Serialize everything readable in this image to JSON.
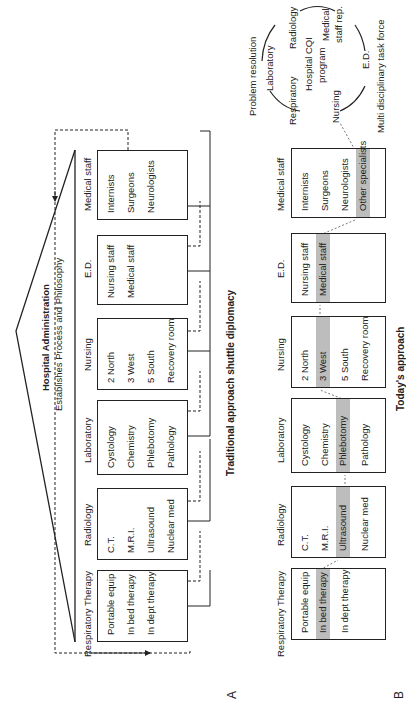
{
  "panel_a": {
    "label": "A",
    "title": "Hospital Administration",
    "subtitle": "Establishes Process and Philosophy",
    "caption": "Traditional approach shuttle diplomacy",
    "departments": [
      {
        "name": "Respiratory Therapy",
        "items": [
          "Portable equip",
          "In bed therapy",
          "In dept therapy"
        ]
      },
      {
        "name": "Radiology",
        "items": [
          "C.T.",
          "M.R.I.",
          "Ultrasound",
          "Nuclear med"
        ]
      },
      {
        "name": "Laboratory",
        "items": [
          "Cystology",
          "Chemistry",
          "Phlebotomy",
          "Pathology"
        ]
      },
      {
        "name": "Nursing",
        "items": [
          "2 North",
          "3 West",
          "5 South",
          "Recovery room"
        ]
      },
      {
        "name": "E.D.",
        "items": [
          "Nursing staff",
          "Medical staff"
        ]
      },
      {
        "name": "Medical staff",
        "items": [
          "Internists",
          "Surgeons",
          "Neurologists"
        ]
      }
    ]
  },
  "panel_b": {
    "label": "B",
    "caption": "Today's approach",
    "departments": [
      {
        "name": "Respiratory Therapy",
        "items": [
          "Portable equip",
          "In bed therapy",
          "In dept therapy"
        ],
        "highlight": 1
      },
      {
        "name": "Radiology",
        "items": [
          "C.T.",
          "M.R.I.",
          "Ultrasound",
          "Nuclear med"
        ],
        "highlight": 2
      },
      {
        "name": "Laboratory",
        "items": [
          "Cystology",
          "Chemistry",
          "Phlebotomy",
          "Pathology"
        ],
        "highlight": 2
      },
      {
        "name": "Nursing",
        "items": [
          "2 North",
          "3 West",
          "5 South",
          "Recovery room"
        ],
        "highlight": 1
      },
      {
        "name": "E.D.",
        "items": [
          "Nursing staff",
          "Medical staff"
        ],
        "highlight": 1
      },
      {
        "name": "Medical staff",
        "items": [
          "Internists",
          "Surgeons",
          "Neurologists",
          "Other specialists"
        ],
        "highlight": 3
      }
    ],
    "cycle": {
      "top_label": "Problem resolution",
      "center": [
        "Hospital CQI",
        "program"
      ],
      "members": [
        "Laboratory",
        "Radiology",
        "Medical",
        "staff rep.",
        "E.D.",
        "Nursing",
        "Respiratory"
      ],
      "bottom_label": "Multi disciplinary task force"
    }
  }
}
